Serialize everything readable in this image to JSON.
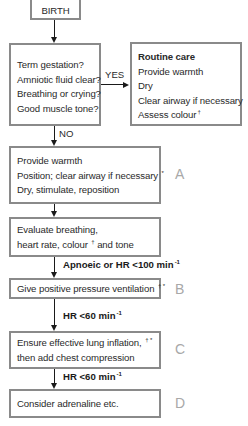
{
  "birth": {
    "label": "BIRTH"
  },
  "assessment": {
    "lines": [
      "Term gestation?",
      "Amniotic fluid clear?",
      "Breathing or crying?",
      "Good muscle tone?"
    ]
  },
  "yes_label": "YES",
  "no_label": "NO",
  "routine_care": {
    "title": "Routine care",
    "lines": [
      "Provide warmth",
      "Dry",
      "Clear airway if necessary",
      "Assess colour"
    ],
    "footnote_mark": "†"
  },
  "steps": {
    "a": {
      "letter": "A",
      "lines": [
        "Provide warmth",
        "Position; clear airway if necessary",
        "Dry, stimulate, reposition"
      ],
      "line2_mark": "*"
    },
    "evaluate": {
      "line1": "Evaluate breathing,",
      "line2_pre": "heart rate, colour",
      "line2_mark": "†",
      "line2_post": " and tone"
    },
    "b": {
      "letter": "B",
      "text": "Give positive pressure ventilation",
      "mark": "† *"
    },
    "c": {
      "letter": "C",
      "line1": "Ensure effective lung inflation,",
      "line1_mark": "† *",
      "line2": "then add chest compression"
    },
    "d": {
      "letter": "D",
      "text": "Consider adrenaline etc."
    }
  },
  "conditions": {
    "apnoeic": {
      "text": "Apnoeic or HR <100 min",
      "sup": "-1"
    },
    "hr60_first": {
      "text": "HR <60 min",
      "sup": "-1"
    },
    "hr60_second": {
      "text": "HR <60 min",
      "sup": "-1"
    }
  },
  "colors": {
    "border": "#8a8a8a",
    "arrow": "#1a1a1a",
    "letter": "#a8a8a8"
  }
}
